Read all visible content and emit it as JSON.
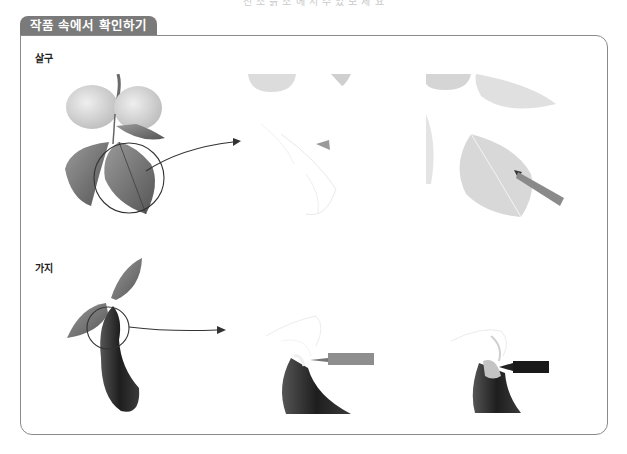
{
  "page": {
    "cut_caption": "전 소 흙 소 에 서 수 있 보 세 요",
    "tab_title": "작품 속에서 확인하기"
  },
  "sections": [
    {
      "label": "살구",
      "subject": "apricot",
      "panels": [
        {
          "name": "finished-apricot-illustration",
          "description": "Two apricots with leaves, circle highlighting lower leaf"
        },
        {
          "name": "apricot-leaf-sketch-stage",
          "description": "Faint line sketch of leaf with pencil tip"
        },
        {
          "name": "apricot-leaf-coloring-stage",
          "description": "Leaf being shaded with colored pencil"
        }
      ]
    },
    {
      "label": "가지",
      "subject": "eggplant",
      "panels": [
        {
          "name": "finished-eggplant-illustration",
          "description": "Eggplant with two leaves, circle highlighting calyx"
        },
        {
          "name": "eggplant-calyx-sketch-stage",
          "description": "Calyx sketch with pencil tip"
        },
        {
          "name": "eggplant-calyx-coloring-stage",
          "description": "Calyx being shaded with black pencil"
        }
      ]
    }
  ],
  "colors": {
    "tab_bg": "#7a7a7a",
    "border": "#8a8a8a",
    "apricot": "#d8d8d8",
    "leaf": "#7c7c7c",
    "eggplant": "#2e2e2e"
  }
}
